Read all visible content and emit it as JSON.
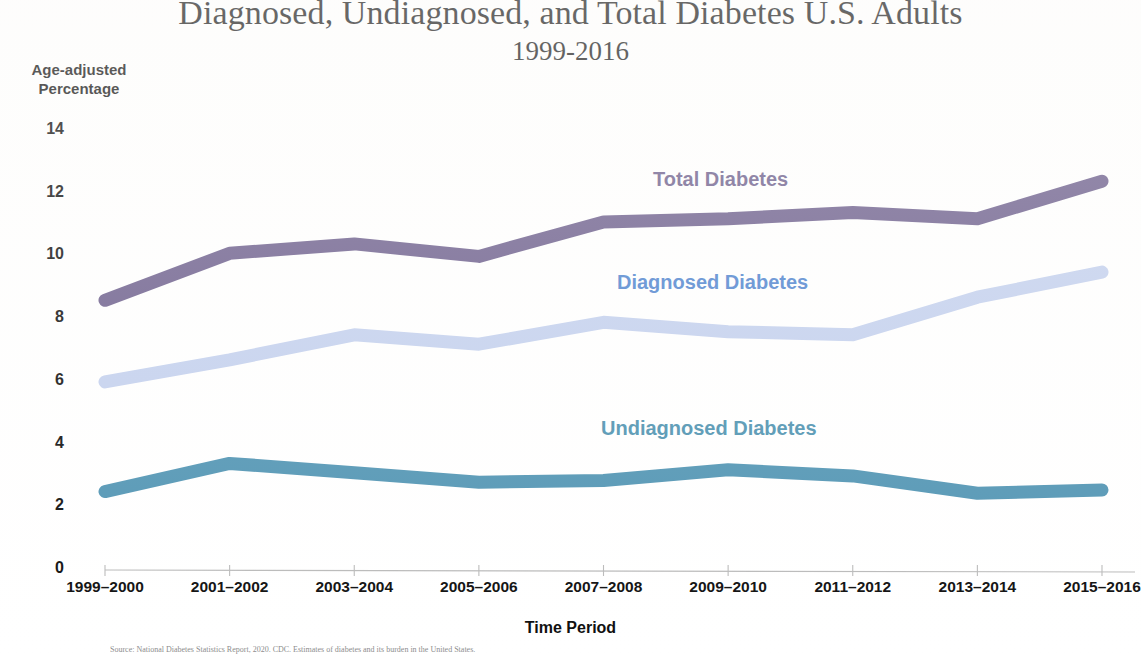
{
  "chart_data": {
    "type": "line",
    "title": "Diagnosed, Undiagnosed, and Total Diabetes U.S. Adults",
    "subtitle": "1999-2016",
    "xlabel": "Time Period",
    "ylabel": "Age-adjusted Percentage",
    "ylabel_line1": "Age-adjusted",
    "ylabel_line2": "Percentage",
    "grid": false,
    "legend_position": "in-plot-labels",
    "ylim": [
      0,
      14
    ],
    "yticks": [
      0,
      2,
      4,
      6,
      8,
      10,
      12,
      14
    ],
    "categories": [
      "1999–2000",
      "2001–2002",
      "2003–2004",
      "2005–2006",
      "2007–2008",
      "2009–2010",
      "2011–2012",
      "2013–2014",
      "2015–2016"
    ],
    "series": [
      {
        "name": "Total Diabetes",
        "color": "#6d5f8d",
        "values": [
          8.6,
          10.1,
          10.4,
          10.0,
          11.1,
          11.2,
          11.4,
          11.2,
          12.4
        ]
      },
      {
        "name": "Diagnosed Diabetes",
        "color": "#c3d0ee",
        "label_color": "#4f84cf",
        "values": [
          6.0,
          6.7,
          7.5,
          7.2,
          7.9,
          7.6,
          7.5,
          8.7,
          9.5
        ]
      },
      {
        "name": "Undiagnosed Diabetes",
        "color": "#5094b3",
        "label_color": "#4d92b0",
        "values": [
          2.5,
          3.4,
          3.1,
          2.8,
          2.85,
          3.2,
          3.0,
          2.45,
          2.55
        ]
      }
    ],
    "annotations": [
      {
        "text": "Total Diabetes",
        "color": "#6d5f8d"
      },
      {
        "text": "Diagnosed Diabetes",
        "color": "#4f84cf"
      },
      {
        "text": "Undiagnosed Diabetes",
        "color": "#4d92b0"
      }
    ],
    "source_note": "Source: National Diabetes Statistics Report, 2020. CDC. Estimates of diabetes and its burden in the United States."
  },
  "axis": {
    "y_ticks": [
      "14",
      "12",
      "10",
      "8",
      "6",
      "4",
      "2",
      "0"
    ],
    "x_ticks": [
      "1999–2000",
      "2001–2002",
      "2003–2004",
      "2005–2006",
      "2007–2008",
      "2009–2010",
      "2011–2012",
      "2013–2014",
      "2015–2016"
    ]
  }
}
